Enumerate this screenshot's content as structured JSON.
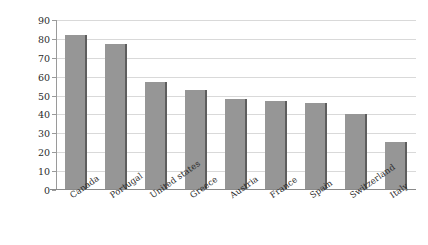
{
  "chart_data": {
    "type": "bar",
    "title": "",
    "subtitle": "",
    "xlabel": "",
    "ylabel": "Assimilation Index",
    "ylim": [
      0,
      90
    ],
    "yticks": [
      0,
      10,
      20,
      30,
      40,
      50,
      60,
      70,
      80,
      90
    ],
    "ytick_labels": [
      "0",
      "10",
      "20",
      "30",
      "40",
      "50",
      "60",
      "70",
      "80",
      "90"
    ],
    "grid": "horizontal",
    "legend": "none",
    "orientation": "vertical",
    "categories": [
      "Canada",
      "Portugal",
      "United states",
      "Greece",
      "Austria",
      "France",
      "Spain",
      "Switzerland",
      "Italy"
    ],
    "values": [
      82,
      77.5,
      57,
      53,
      48,
      47,
      46,
      40,
      25.5
    ],
    "series": [
      {
        "name": "Assimilation Index",
        "values": [
          82,
          77.5,
          57,
          53,
          48,
          47,
          46,
          40,
          25.5
        ]
      }
    ],
    "colors": {
      "bar_fill": "#969696",
      "bar_edge": "#5e5e5e",
      "gridline": "#d9d9d9",
      "axis_line": "#8a8a8a",
      "text": "#2b2b2b",
      "background": "#ffffff"
    }
  }
}
